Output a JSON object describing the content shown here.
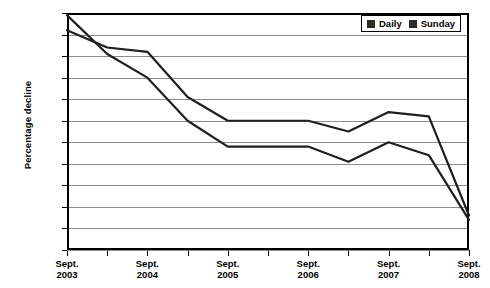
{
  "chart_data": {
    "type": "line",
    "title": "",
    "xlabel": "",
    "ylabel": "Percentage decline",
    "ylim": [
      -5.5,
      0
    ],
    "yticks": [
      "0%",
      "-0.5%",
      "-1%",
      "-1.5%",
      "-2%",
      "-2.5%",
      "-3%",
      "-3.5%",
      "-4%",
      "-4.5%",
      "-5%",
      "-5.5%"
    ],
    "ytick_values": [
      0,
      -0.5,
      -1,
      -1.5,
      -2,
      -2.5,
      -3,
      -3.5,
      -4,
      -4.5,
      -5,
      -5.5
    ],
    "grid": true,
    "legend_position": "top-right",
    "categories": [
      "Sept. 2003",
      "Mar. 2004",
      "Sept. 2004",
      "Mar. 2005",
      "Sept. 2005",
      "Mar. 2006",
      "Sept. 2006",
      "Mar. 2007",
      "Sept. 2007",
      "Mar. 2008",
      "Sept. 2008"
    ],
    "xtick_labels": [
      {
        "line1": "Sept.",
        "line2": "2003"
      },
      {
        "line1": "Sept.",
        "line2": "2004"
      },
      {
        "line1": "Sept.",
        "line2": "2005"
      },
      {
        "line1": "Sept.",
        "line2": "2006"
      },
      {
        "line1": "Sept.",
        "line2": "2007"
      },
      {
        "line1": "Sept.",
        "line2": "2008"
      }
    ],
    "series": [
      {
        "name": "Daily",
        "color": "#1f1f1f",
        "values": [
          -0.4,
          -0.8,
          -0.9,
          -1.95,
          -2.5,
          -2.5,
          -2.5,
          -2.75,
          -2.3,
          -2.4,
          -4.7
        ]
      },
      {
        "name": "Sunday",
        "color": "#1f1f1f",
        "values": [
          -0.05,
          -0.95,
          -1.5,
          -2.5,
          -3.1,
          -3.1,
          -3.1,
          -3.45,
          -3.0,
          -3.3,
          -4.8
        ]
      }
    ]
  },
  "legend": {
    "entries": [
      {
        "label": "Daily",
        "swatch": "dark-square-marker"
      },
      {
        "label": "Sunday",
        "swatch": "dark-square-marker"
      }
    ]
  }
}
